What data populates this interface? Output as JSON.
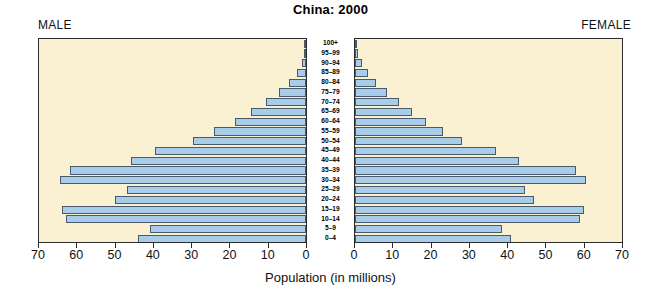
{
  "chart_data": {
    "type": "bar",
    "subtype": "population-pyramid",
    "title": "China: 2000",
    "xlabel": "Population (in millions)",
    "ylabel": "",
    "left_panel_label": "MALE",
    "right_panel_label": "FEMALE",
    "categories": [
      "100+",
      "95–99",
      "90–94",
      "85–89",
      "80–84",
      "75–79",
      "70–74",
      "65–69",
      "60–64",
      "55–59",
      "50–54",
      "45–49",
      "40–44",
      "35–39",
      "30–34",
      "25–29",
      "20–24",
      "15–19",
      "10–14",
      "5–9",
      "0–4"
    ],
    "xlim": [
      0,
      70
    ],
    "xticks": [
      0,
      10,
      20,
      30,
      40,
      50,
      60,
      70
    ],
    "left_xtick_labels": [
      "70",
      "60",
      "50",
      "40",
      "30",
      "20",
      "10",
      "0"
    ],
    "right_xtick_labels": [
      "0",
      "10",
      "20",
      "30",
      "40",
      "50",
      "60",
      "70"
    ],
    "grid": false,
    "legend": "none",
    "series": [
      {
        "name": "MALE",
        "side": "left",
        "values": [
          0.1,
          0.4,
          1.1,
          2.4,
          4.4,
          7.0,
          10.5,
          14.5,
          18.5,
          24.0,
          29.5,
          39.5,
          46.0,
          62.0,
          64.5,
          47.0,
          50.0,
          64.0,
          63.0,
          41.0,
          44.0
        ]
      },
      {
        "name": "FEMALE",
        "side": "right",
        "values": [
          0.2,
          0.7,
          1.8,
          3.4,
          5.6,
          8.3,
          11.5,
          15.0,
          18.5,
          23.0,
          28.0,
          37.0,
          43.0,
          58.0,
          60.5,
          44.5,
          47.0,
          60.0,
          59.0,
          38.5,
          41.0
        ]
      }
    ],
    "colors": {
      "bar_fill": "#a8cdea",
      "bar_outline": "#4a5a6a",
      "panel_background": "#faf0d2",
      "panel_border": "#2b2b2b",
      "text": "#111111",
      "page_background": "#ffffff"
    }
  }
}
